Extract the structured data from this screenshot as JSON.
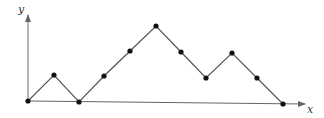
{
  "diagram": {
    "type": "lattice-path",
    "axes": {
      "x_label": "x",
      "y_label": "y",
      "origin": [
        28,
        101
      ],
      "x_end": [
        305,
        104
      ],
      "y_end": [
        28,
        15
      ]
    },
    "points": [
      [
        28,
        101
      ],
      [
        54,
        75
      ],
      [
        79,
        102
      ],
      [
        104,
        76
      ],
      [
        130,
        51
      ],
      [
        156,
        26
      ],
      [
        181,
        52
      ],
      [
        206,
        78
      ],
      [
        232,
        53
      ],
      [
        257,
        78
      ],
      [
        283,
        104
      ]
    ],
    "steps": [
      "up",
      "down",
      "up",
      "up",
      "up",
      "down",
      "down",
      "up",
      "down",
      "down"
    ],
    "colors": {
      "line": "#555555",
      "point": "#111111",
      "axis": "#666666"
    }
  }
}
